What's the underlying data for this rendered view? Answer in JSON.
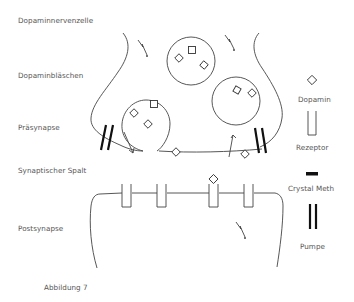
{
  "labels": {
    "nerve_cell": "Dopaminnervenzelle",
    "vesicles": "Dopaminbläschen",
    "presynapse": "Präsynapse",
    "cleft": "Synaptischer Spalt",
    "postsynapse": "Postsynapse",
    "caption": "Abbildung 7"
  },
  "legend": [
    {
      "symbol": "diamond-icon",
      "label": "Dopamin"
    },
    {
      "symbol": "receptor-icon",
      "label": "Rezeptor"
    },
    {
      "symbol": "bar-icon",
      "label": "Crystal Meth"
    },
    {
      "symbol": "pump-icon",
      "label": "Pumpe"
    }
  ],
  "colors": {
    "line": "#444444",
    "text": "#555555",
    "pump": "#111111"
  }
}
